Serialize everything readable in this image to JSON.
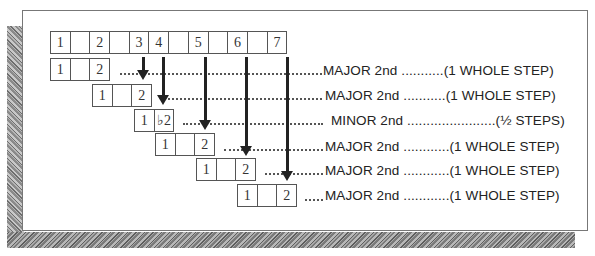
{
  "diagram": {
    "scale_row": {
      "cells": [
        "1",
        "",
        "2",
        "",
        "3",
        "4",
        "",
        "5",
        "",
        "6",
        "",
        "7"
      ]
    },
    "interval_rows": [
      {
        "cells": [
          "1",
          "",
          "2"
        ],
        "leader": ".........",
        "interval": "MAJOR 2nd",
        "leader2": "...........",
        "steps": "(1 WHOLE STEP)"
      },
      {
        "cells": [
          "1",
          "",
          "2"
        ],
        "leader": "........",
        "interval": "MAJOR 2nd",
        "leader2": "...........",
        "steps": "(1 WHOLE STEP)"
      },
      {
        "cells": [
          "1",
          "♭2"
        ],
        "leader": "........",
        "interval": "MINOR 2nd",
        "leader2": ".......................",
        "steps": "(½ STEPS)"
      },
      {
        "cells": [
          "1",
          "",
          "2"
        ],
        "leader": "........",
        "interval": "MAJOR 2nd",
        "leader2": "............",
        "steps": "(1 WHOLE STEP)"
      },
      {
        "cells": [
          "1",
          "",
          "2"
        ],
        "leader": "........",
        "interval": "MAJOR 2nd",
        "leader2": "............",
        "steps": "(1 WHOLE STEP)"
      },
      {
        "cells": [
          "1",
          "",
          "2"
        ],
        "leader": ".....",
        "interval": "MAJOR 2nd",
        "leader2": "............",
        "steps": "(1 WHOLE STEP)"
      }
    ],
    "text_lines": [
      "MAJOR 2nd ...........(1 WHOLE STEP)",
      "MAJOR 2nd ...........(1 WHOLE STEP)",
      "MINOR 2nd .......................(½ STEPS)",
      "MAJOR 2nd ............(1 WHOLE STEP)",
      "MAJOR 2nd ............(1 WHOLE STEP)",
      "MAJOR 2nd ............(1 WHOLE STEP)"
    ]
  }
}
